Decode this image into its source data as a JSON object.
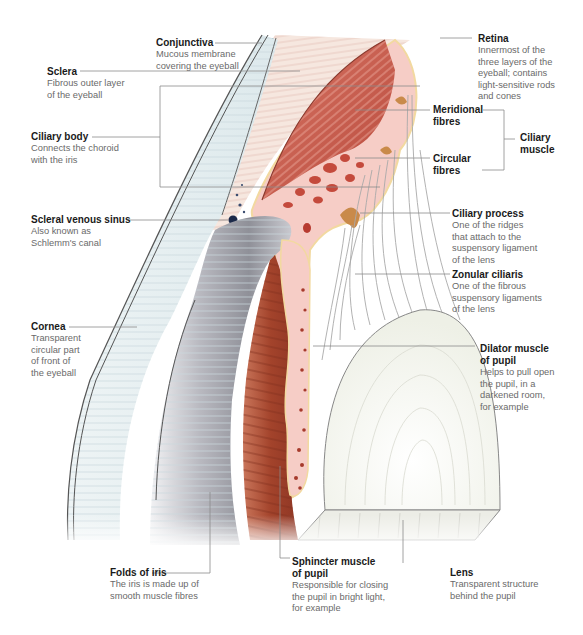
{
  "diagram": {
    "colors": {
      "sclera": "#f3e4dc",
      "cornea": "#e4eef0",
      "ciliary_muscle": "#c8574a",
      "ciliary_body_tissue": "#f5c9c4",
      "iris": "#a8442c",
      "lens": "#f5f6ef",
      "conjunctiva_blue": "#2f6d8c",
      "leader_line": "#8a8a8a",
      "zonule_fibre": "#a9a9a9",
      "label_title": "#1a1a1a",
      "label_desc": "#6a6a6a"
    }
  },
  "labels": {
    "conjunctiva": {
      "title": "Conjunctiva",
      "desc": "Mucous membrane\ncovering the eyeball"
    },
    "sclera": {
      "title": "Sclera",
      "desc": "Fibrous outer layer\nof the eyeball"
    },
    "ciliary_body": {
      "title": "Ciliary body",
      "desc": "Connects the choroid\nwith the iris"
    },
    "scleral_venous_sinus": {
      "title": "Scleral venous sinus",
      "desc": "Also known as\nSchlemm's canal"
    },
    "cornea": {
      "title": "Cornea",
      "desc": "Transparent\ncircular part\nof front of\nthe eyeball"
    },
    "folds_of_iris": {
      "title": "Folds of iris",
      "desc": "The iris is made up of\nsmooth muscle fibres"
    },
    "sphincter_muscle": {
      "title": "Sphincter muscle\nof pupil",
      "desc": "Responsible for closing\nthe pupil in bright light,\nfor example"
    },
    "lens": {
      "title": "Lens",
      "desc": "Transparent structure\nbehind the pupil"
    },
    "retina": {
      "title": "Retina",
      "desc": "Innermost of the\nthree layers of the\neyeball; contains\nlight-sensitive rods\nand cones"
    },
    "meridional_fibres": {
      "title": "Meridional\nfibres"
    },
    "circular_fibres": {
      "title": "Circular\nfibres"
    },
    "ciliary_muscle": {
      "title": "Ciliary\nmuscle"
    },
    "ciliary_process": {
      "title": "Ciliary process",
      "desc": "One of the ridges\nthat attach to the\nsuspensory ligament\nof the lens"
    },
    "zonular_ciliaris": {
      "title": "Zonular ciliaris",
      "desc": "One of the fibrous\nsuspensory ligaments\nof the lens"
    },
    "dilator_muscle": {
      "title": "Dilator muscle\nof pupil",
      "desc": "Helps to pull open\nthe pupil, in a\ndarkened room,\nfor example"
    }
  }
}
